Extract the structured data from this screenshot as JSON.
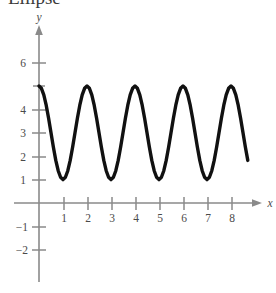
{
  "figure": {
    "clipped_heading": "Ellipse",
    "background_color": "#ffffff",
    "axis_color": "#8a8a8a",
    "curve_color": "#111111"
  },
  "axes": {
    "x_axis_name": "x",
    "y_axis_name": "y",
    "x_ticks": [
      {
        "value": 1,
        "label": "1"
      },
      {
        "value": 2,
        "label": "2"
      },
      {
        "value": 3,
        "label": "3"
      },
      {
        "value": 4,
        "label": "4"
      },
      {
        "value": 5,
        "label": "5"
      },
      {
        "value": 6,
        "label": "6"
      },
      {
        "value": 7,
        "label": "7"
      },
      {
        "value": 8,
        "label": "8"
      }
    ],
    "y_ticks": [
      {
        "value": 6,
        "label": "6"
      },
      {
        "value": 5,
        "label": ""
      },
      {
        "value": 4,
        "label": "4"
      },
      {
        "value": 3,
        "label": "3"
      },
      {
        "value": 2,
        "label": "2"
      },
      {
        "value": 1,
        "label": "1"
      },
      {
        "value": -1,
        "label": "−1"
      },
      {
        "value": -2,
        "label": "−2"
      }
    ]
  },
  "chart_data": {
    "type": "line",
    "title": "Ellipse",
    "xlabel": "x",
    "ylabel": "y",
    "xlim": [
      -0.35,
      9.0
    ],
    "ylim": [
      -2.6,
      6.6
    ],
    "grid": false,
    "legend": null,
    "curve_description": "Sinusoidal (cosine) wave oscillating between y = 1 and y = 5, midline y = 3, amplitude 2, period 2 units, maximum at x = 0",
    "function": "y = 3 + 2cos(pi*x)",
    "amplitude": 2,
    "midline": 3,
    "period": 2,
    "maximum": 5,
    "minimum": 1,
    "x_start": 0,
    "x_end": 8.7,
    "maxima_x": [
      0,
      1.6,
      3.6,
      5.6,
      7.6
    ],
    "minima_x": [
      0.6,
      2.6,
      4.6,
      6.6
    ],
    "x": [
      0,
      0.1,
      0.2,
      0.3,
      0.4,
      0.5,
      0.6,
      0.7,
      0.8,
      0.9,
      1,
      1.1,
      1.2,
      1.3,
      1.4,
      1.5,
      1.6,
      1.7,
      1.8,
      1.9,
      2,
      2.1,
      2.2,
      2.3,
      2.4,
      2.5,
      2.6,
      2.7,
      2.8,
      2.9,
      3,
      3.1,
      3.2,
      3.3,
      3.4,
      3.5,
      3.6,
      3.7,
      3.8,
      3.9,
      4,
      4.1,
      4.2,
      4.3,
      4.4,
      4.5,
      4.6,
      4.7,
      4.8,
      4.9,
      5,
      5.1,
      5.2,
      5.3,
      5.4,
      5.5,
      5.6,
      5.7,
      5.8,
      5.9,
      6,
      6.1,
      6.2,
      6.3,
      6.4,
      6.5,
      6.6,
      6.7,
      6.8,
      6.9,
      7,
      7.1,
      7.2,
      7.3,
      7.4,
      7.5,
      7.6,
      7.7,
      7.8,
      7.9,
      8,
      8.1,
      8.2,
      8.3,
      8.4,
      8.5,
      8.6,
      8.7
    ],
    "y": [
      5.0,
      4.9,
      4.62,
      4.18,
      3.62,
      3.0,
      2.38,
      1.82,
      1.38,
      1.1,
      1.0,
      1.1,
      1.38,
      1.82,
      2.38,
      3.0,
      3.62,
      4.18,
      4.62,
      4.9,
      5.0,
      4.9,
      4.62,
      4.18,
      3.62,
      3.0,
      2.38,
      1.82,
      1.38,
      1.1,
      1.0,
      1.1,
      1.38,
      1.82,
      2.38,
      3.0,
      3.62,
      4.18,
      4.62,
      4.9,
      5.0,
      4.9,
      4.62,
      4.18,
      3.62,
      3.0,
      2.38,
      1.82,
      1.38,
      1.1,
      1.0,
      1.1,
      1.38,
      1.82,
      2.38,
      3.0,
      3.62,
      4.18,
      4.62,
      4.9,
      5.0,
      4.9,
      4.62,
      4.18,
      3.62,
      3.0,
      2.38,
      1.82,
      1.38,
      1.1,
      1.0,
      1.1,
      1.38,
      1.82,
      2.38,
      3.0,
      3.62,
      4.18,
      4.62,
      4.9,
      5.0,
      4.9,
      4.62,
      4.18,
      3.62,
      3.0,
      2.38,
      1.82
    ]
  }
}
